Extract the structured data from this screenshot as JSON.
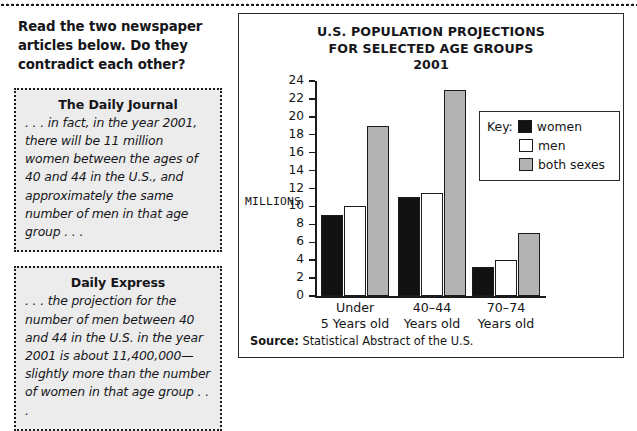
{
  "worksheet": {
    "prompt": "Read the two newspaper articles below. Do they contradict each other?",
    "articles": [
      {
        "title": "The Daily Journal",
        "body": ". . . in fact, in the year 2001, there will be 11 million women between the ages of 40 and 44 in the U.S., and approximately the same number of men in that age group . . ."
      },
      {
        "title": "Daily Express",
        "body": ". . . the projection for the number of men between 40 and 44 in the U.S. in the year 2001 is about 11,400,000—slightly more than the number of women in that age group . . ."
      }
    ]
  },
  "chart_panel": {
    "title_line1": "U.S. POPULATION PROJECTIONS",
    "title_line2": "FOR SELECTED AGE GROUPS",
    "title_line3": "2001",
    "key_label": "Key:",
    "source_label": "Source:",
    "source_text": "Statistical Abstract of the U.S."
  },
  "chart_data": {
    "type": "bar",
    "title": "U.S. POPULATION PROJECTIONS FOR SELECTED AGE GROUPS 2001",
    "xlabel": "",
    "ylabel": "MILLIONS",
    "ylim": [
      0,
      24
    ],
    "yticks": [
      0,
      2,
      4,
      6,
      8,
      10,
      12,
      14,
      16,
      18,
      20,
      22,
      24
    ],
    "ytick_labels": [
      "0",
      "2",
      "4",
      "6",
      "8",
      "10",
      "12",
      "14",
      "16",
      "18",
      "20",
      "22",
      "24"
    ],
    "grid": false,
    "legend_position": "inside-upper-right",
    "categories": [
      "Under 5 Years old",
      "40–44 Years old",
      "70–74 Years old"
    ],
    "category_lines": [
      [
        "Under",
        "5 Years old"
      ],
      [
        "40–44",
        "Years old"
      ],
      [
        "70–74",
        "Years old"
      ]
    ],
    "series": [
      {
        "name": "women",
        "color": "#121212",
        "values": [
          9,
          11,
          3.2
        ]
      },
      {
        "name": "men",
        "color": "#ffffff",
        "values": [
          10,
          11.5,
          4
        ]
      },
      {
        "name": "both sexes",
        "color": "#b3b3b3",
        "values": [
          19,
          23,
          7
        ]
      }
    ]
  }
}
